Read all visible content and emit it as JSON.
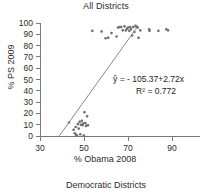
{
  "chart_data": {
    "type": "scatter",
    "title": "All Districts",
    "caption": "Democratic Districts",
    "xlabel": "% Obama 2008",
    "ylabel": "% PS 2009",
    "xlim": [
      30,
      98
    ],
    "ylim": [
      0,
      100
    ],
    "xticks": [
      30,
      50,
      70,
      90
    ],
    "yticks": [
      0,
      10,
      20,
      30,
      40,
      50,
      60,
      70,
      80,
      90,
      100
    ],
    "grid": false,
    "legend": "none",
    "annotations": {
      "equation": "ŷ = - 105.37+2.72x",
      "r_squared": "R² = 0.772"
    },
    "fit": {
      "intercept": -105.37,
      "slope": 2.72,
      "r2": 0.772,
      "x_start": 38.7,
      "x_end": 74.0
    },
    "point_color": "#6f6f6f",
    "line_color": "#8a8a8a",
    "axis_color": "#7a7a7a",
    "points": [
      [
        43.2,
        12.0
      ],
      [
        45.3,
        5.5
      ],
      [
        45.8,
        2.5
      ],
      [
        46.2,
        8.0
      ],
      [
        46.4,
        1.0
      ],
      [
        46.8,
        0.5
      ],
      [
        47.2,
        10.5
      ],
      [
        47.6,
        6.5
      ],
      [
        48.0,
        12.5
      ],
      [
        48.3,
        1.5
      ],
      [
        48.6,
        10.0
      ],
      [
        49.0,
        13.5
      ],
      [
        49.3,
        9.5
      ],
      [
        49.6,
        11.0
      ],
      [
        49.9,
        0.5
      ],
      [
        50.2,
        21.0
      ],
      [
        50.6,
        11.5
      ],
      [
        50.9,
        9.0
      ],
      [
        51.4,
        17.5
      ],
      [
        51.8,
        9.5
      ],
      [
        53.8,
        93.0
      ],
      [
        58.0,
        92.5
      ],
      [
        59.8,
        86.5
      ],
      [
        61.0,
        87.0
      ],
      [
        62.5,
        91.0
      ],
      [
        64.8,
        88.0
      ],
      [
        65.5,
        96.0
      ],
      [
        66.2,
        96.5
      ],
      [
        66.9,
        96.5
      ],
      [
        67.6,
        93.5
      ],
      [
        68.4,
        97.0
      ],
      [
        69.0,
        93.5
      ],
      [
        69.6,
        95.0
      ],
      [
        70.1,
        96.0
      ],
      [
        70.6,
        93.0
      ],
      [
        71.0,
        96.5
      ],
      [
        71.4,
        94.5
      ],
      [
        71.9,
        89.0
      ],
      [
        72.4,
        96.5
      ],
      [
        72.9,
        92.0
      ],
      [
        73.4,
        97.5
      ],
      [
        73.8,
        97.0
      ],
      [
        74.4,
        96.0
      ],
      [
        74.8,
        87.0
      ],
      [
        75.6,
        93.5
      ],
      [
        79.6,
        94.5
      ],
      [
        79.8,
        93.0
      ],
      [
        83.8,
        93.0
      ],
      [
        87.4,
        94.5
      ],
      [
        88.2,
        93.5
      ]
    ]
  }
}
